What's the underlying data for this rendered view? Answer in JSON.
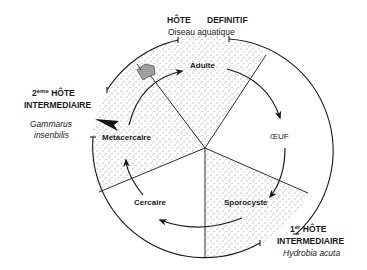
{
  "diagram": {
    "type": "life-cycle",
    "hosts": {
      "definitive": {
        "title_left": "HÔTE",
        "title_right": "DEFINITIF",
        "species": "Oiseau aquatique"
      },
      "second_intermediate": {
        "ordinal": "2",
        "ordinal_sup": "eme",
        "title_line1": "HÔTE",
        "title_line2": "INTERMEDIAIRE",
        "species_line1": "Gammarus",
        "species_line2": "insenbilis"
      },
      "first_intermediate": {
        "ordinal": "1",
        "ordinal_sup": "er",
        "title_line1": "HÔTE",
        "title_line2": "INTERMEDIAIRE",
        "species": "Hydrobia acuta"
      }
    },
    "stages": {
      "adulte": "Adulte",
      "oeuf": "ŒUF",
      "sporocyste": "Sporocyste",
      "cercaire": "Cercaire",
      "metacercaire": "Metacercaire"
    },
    "cycle_order": [
      "Adulte",
      "ŒUF",
      "Sporocyste",
      "Cercaire",
      "Metacercaire"
    ],
    "colors": {
      "line": "#1a1a1a",
      "stipple": "#8a8a8a",
      "polygon_fill": "#9a9a9a",
      "background": "#ffffff"
    }
  }
}
